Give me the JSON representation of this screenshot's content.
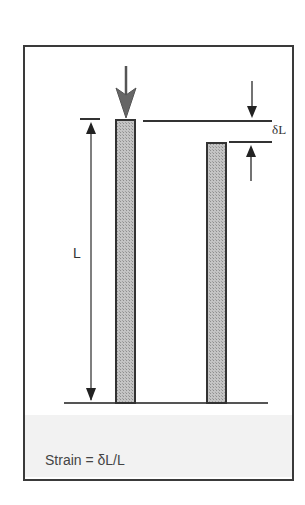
{
  "diagram": {
    "labels": {
      "length": "L",
      "delta_length": "δL",
      "formula": "Strain = δL/L"
    },
    "elements": {
      "original_bar": {
        "description": "original column of length L under downward load"
      },
      "compressed_bar": {
        "description": "compressed column shortened by δL"
      },
      "load_arrow": {
        "description": "large downward force arrow on original bar"
      },
      "length_dimension": {
        "description": "double-ended dimension arrow showing L"
      },
      "delta_dimension": {
        "description": "inward arrows indicating δL between top lines"
      },
      "ground_line": {
        "description": "base line"
      }
    },
    "colors": {
      "frame": "#3a3a3a",
      "bar_fill": "#b8b8b8",
      "bar_stroke": "#333333",
      "arrow": "#444444",
      "background": "#ffffff",
      "footer_band": "#f2f2f2"
    }
  }
}
